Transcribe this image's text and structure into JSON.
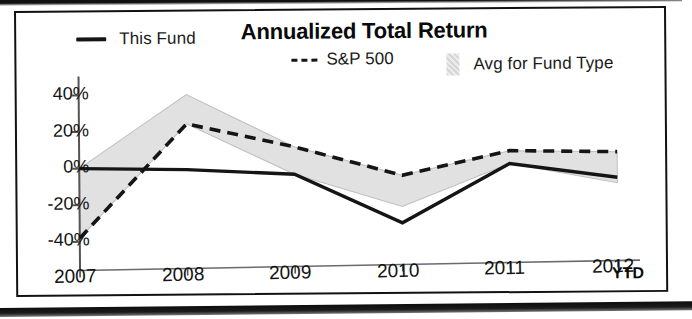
{
  "chart_data": {
    "type": "line",
    "title": "Annualized Total Return",
    "xlabel": "",
    "ylabel": "",
    "categories": [
      "2007",
      "2008",
      "2009",
      "2010",
      "2011",
      "2012"
    ],
    "x_axis_note": "YTD",
    "ytick_labels": [
      "40%",
      "20%",
      "0%",
      "-20%",
      "-40%"
    ],
    "ytick_values": [
      40,
      20,
      0,
      -20,
      -40
    ],
    "ylim": [
      -48,
      46
    ],
    "grid": false,
    "legend_position": "top",
    "series": [
      {
        "name": "This Fund",
        "style": "solid",
        "color": "#151515",
        "values": [
          0,
          -1,
          -4,
          -31,
          1,
          -7
        ]
      },
      {
        "name": "S&P 500",
        "style": "dashed",
        "color": "#151515",
        "values": [
          -38,
          24,
          11,
          -5,
          8,
          7
        ]
      },
      {
        "name": "Avg for Fund Type",
        "style": "band",
        "color": "#dcdcdc",
        "band_upper": [
          0,
          40,
          11,
          -5,
          8,
          7
        ],
        "band_lower": [
          -38,
          24,
          -4,
          -22,
          1,
          -10
        ]
      }
    ]
  },
  "legend": {
    "items": [
      {
        "label": "This Fund",
        "marker": "solid-line-icon"
      },
      {
        "label": "S&P 500",
        "marker": "dashed-line-icon"
      },
      {
        "label": "Avg for Fund Type",
        "marker": "band-swatch-icon"
      }
    ]
  }
}
